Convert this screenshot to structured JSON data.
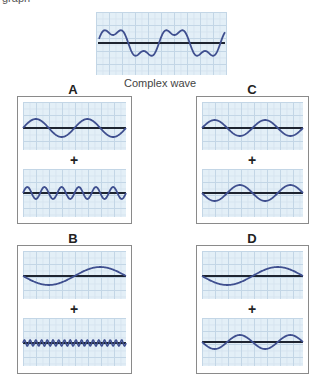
{
  "header": {
    "cut_text": "graph"
  },
  "complex": {
    "caption": "Complex wave"
  },
  "panels": [
    {
      "label": "A",
      "plus": "+"
    },
    {
      "label": "B",
      "plus": "+"
    },
    {
      "label": "C",
      "plus": "+"
    },
    {
      "label": "D",
      "plus": "+"
    }
  ],
  "colors": {
    "wave": "#3f4f8f",
    "axis": "#1e2430",
    "grid_bg": "#e3eff7",
    "grid_line": "#c3d6e6"
  }
}
